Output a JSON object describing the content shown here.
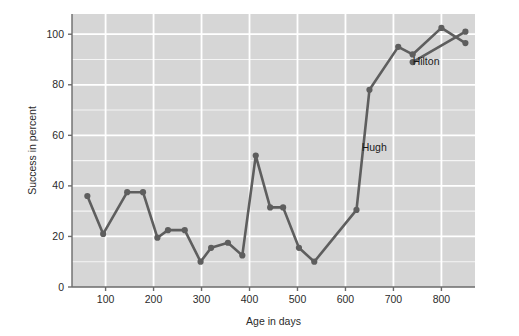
{
  "chart_data": {
    "type": "line",
    "title": "",
    "xlabel": "Age in days",
    "ylabel": "Success in percent",
    "xlim": [
      30,
      870
    ],
    "ylim": [
      0,
      108
    ],
    "xticks": [
      100,
      200,
      300,
      400,
      500,
      600,
      700,
      800
    ],
    "yticks": [
      0,
      20,
      40,
      60,
      80,
      100
    ],
    "grid": true,
    "minor_grid_y_step": 10,
    "legend_position": "inline-annotation",
    "plot_background": "#d6d6d6",
    "grid_color": "#ffffff",
    "line_color": "#5e5e5e",
    "marker_color": "#5e5e5e",
    "axis_color": "#6b6b6b",
    "series": [
      {
        "name": "Hugh",
        "label_text": "Hugh",
        "label_x": 660,
        "label_y": 54,
        "x": [
          62,
          95,
          145,
          178,
          208,
          230,
          265,
          298,
          320,
          355,
          385,
          413,
          443,
          470,
          503,
          535,
          623,
          650,
          710,
          740,
          800,
          850
        ],
        "y": [
          36,
          21,
          37.5,
          37.5,
          19.5,
          22.5,
          22.5,
          10,
          15.5,
          17.5,
          12.5,
          52,
          31.5,
          31.5,
          15.5,
          10,
          30.5,
          78,
          95,
          92,
          102.5,
          96.5
        ]
      },
      {
        "name": "Hilton",
        "label_text": "Hilton",
        "label_x": 768,
        "label_y": 88,
        "x": [
          740,
          850
        ],
        "y": [
          89,
          101
        ]
      }
    ],
    "annotations": [
      {
        "text": "Hugh",
        "x": 660,
        "y": 54
      },
      {
        "text": "Hilton",
        "x": 768,
        "y": 88
      }
    ]
  },
  "axes": {
    "y_title": "Success in percent",
    "x_title": "Age in days",
    "y_tick_labels": [
      "0",
      "20",
      "40",
      "60",
      "80",
      "100"
    ],
    "x_tick_labels": [
      "100",
      "200",
      "300",
      "400",
      "500",
      "600",
      "700",
      "800"
    ]
  }
}
